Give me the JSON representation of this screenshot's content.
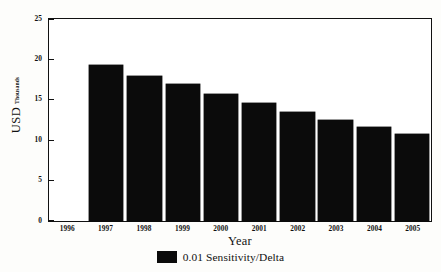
{
  "chart_data": {
    "type": "bar",
    "title": "",
    "xlabel": "Year",
    "ylabel": "USD",
    "ylabel_sub": "Thousands",
    "categories": [
      "1996",
      "1997",
      "1998",
      "1999",
      "2000",
      "2001",
      "2002",
      "2003",
      "2004",
      "2005"
    ],
    "values": [
      0,
      19.3,
      18.0,
      16.9,
      15.7,
      14.6,
      13.5,
      12.5,
      11.6,
      10.8
    ],
    "series": [
      {
        "name": "0.01 Sensitivity/Delta",
        "values": [
          0,
          19.3,
          18.0,
          16.9,
          15.7,
          14.6,
          13.5,
          12.5,
          11.6,
          10.8
        ],
        "color": "#0b0b0b"
      }
    ],
    "ylim": [
      0,
      25
    ],
    "yticks": [
      0,
      5,
      10,
      15,
      20,
      25
    ],
    "ytick_labels": [
      "0",
      "5",
      "10",
      "15",
      "20",
      "25"
    ],
    "grid": false,
    "legend_position": "bottom"
  },
  "legend": {
    "label": "0.01 Sensitivity/Delta",
    "swatch_color": "#0b0b0b"
  },
  "colors": {
    "bar": "#0b0b0b",
    "axis": "#111111",
    "background": "#fdfdfb",
    "plot_background": "#ffffff"
  }
}
